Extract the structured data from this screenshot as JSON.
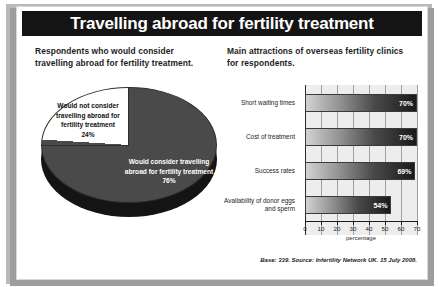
{
  "title": "Travelling abroad for fertility treatment",
  "left_panel": {
    "heading": "Respondents who would consider travelling abroad for fertility treatment.",
    "pie": {
      "slice_white_label": "Would not consider travelling abroad for fertility treatment",
      "slice_white_value": "24%",
      "slice_dark_label": "Would consider travelling abroad for fertility treatment",
      "slice_dark_value": "76%"
    }
  },
  "right_panel": {
    "heading": "Main attractions of overseas fertility clinics for respondents.",
    "source": "Base: 339. Source: Infertility Network UK. 15 July 2008."
  },
  "chart_data": {
    "type": "bar",
    "orientation": "horizontal",
    "title": "Main attractions of overseas fertility clinics for respondents.",
    "categories": [
      "Short waiting times",
      "Cost of treatment",
      "Success rates",
      "Availability of donor eggs and sperm"
    ],
    "values": [
      70,
      70,
      69,
      54
    ],
    "value_labels": [
      "70%",
      "70%",
      "69%",
      "54%"
    ],
    "xlabel": "percentage",
    "ylabel": "",
    "xlim": [
      0,
      70
    ],
    "xticks": [
      0,
      10,
      20,
      30,
      40,
      50,
      60,
      70
    ],
    "xtick_labels": [
      "0",
      "10",
      "20",
      "30",
      "40",
      "50",
      "60",
      "70"
    ],
    "grid": true,
    "legend": "none"
  },
  "pie_data": {
    "type": "pie",
    "title": "Respondents who would consider travelling abroad for fertility treatment.",
    "labels": [
      "Would consider travelling abroad for fertility treatment",
      "Would not consider travelling abroad for fertility treatment"
    ],
    "values": [
      76,
      24
    ],
    "value_labels": [
      "76%",
      "24%"
    ],
    "colors": [
      "#4a4a4a",
      "#ffffff"
    ]
  },
  "colors": {
    "title_bar": "#141414",
    "bar_dark": "#1a1a1a",
    "bar_light": "#d2d2d2",
    "plot_background": "#ededed",
    "page_background": "#b9b9b9"
  }
}
